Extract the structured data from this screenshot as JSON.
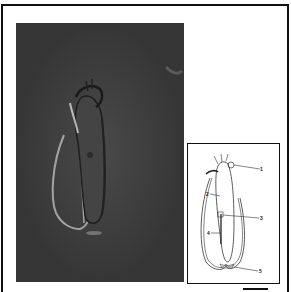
{
  "figure": {
    "photo": {
      "description": "DIC micrograph of elongated ciliate cell with lorica",
      "background_color": "#3b3b3b"
    },
    "inset": {
      "description": "line drawing of the organism with numbered structures",
      "labels": [
        "1",
        "2",
        "3",
        "4",
        "5"
      ]
    },
    "scale_bar": {
      "label": ""
    }
  }
}
